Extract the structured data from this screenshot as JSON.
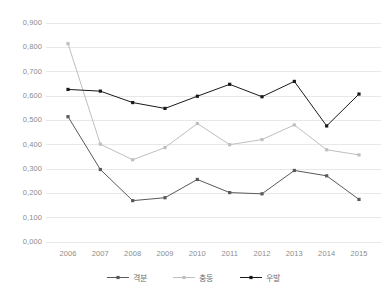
{
  "chart_data": {
    "type": "line",
    "title": "",
    "subtitle": "",
    "xlabel": "",
    "ylabel": "",
    "categories": [
      "2006",
      "2007",
      "2008",
      "2009",
      "2010",
      "2011",
      "2012",
      "2013",
      "2014",
      "2015"
    ],
    "ylim": [
      0.0,
      0.9
    ],
    "ytick_labels": [
      "0,900",
      "0,800",
      "0,700",
      "0,600",
      "0,500",
      "0,400",
      "0,300",
      "0,200",
      "0,100",
      "0,000"
    ],
    "ytick_values": [
      0.9,
      0.8,
      0.7,
      0.6,
      0.5,
      0.4,
      0.3,
      0.2,
      0.1,
      0.0
    ],
    "grid": "horizontal",
    "legend_position": "bottom",
    "decimal_separator": ",",
    "series": [
      {
        "name": "격분",
        "color": "#595959",
        "marker": "square",
        "values": [
          0.515,
          0.298,
          0.17,
          0.182,
          0.257,
          0.203,
          0.198,
          0.294,
          0.272,
          0.175
        ]
      },
      {
        "name": "충동",
        "color": "#bfbfbf",
        "marker": "square",
        "values": [
          0.815,
          0.402,
          0.338,
          0.388,
          0.487,
          0.4,
          0.421,
          0.481,
          0.379,
          0.358
        ]
      },
      {
        "name": "우발",
        "color": "#1a1a1a",
        "marker": "square",
        "values": [
          0.627,
          0.62,
          0.573,
          0.549,
          0.599,
          0.648,
          0.597,
          0.66,
          0.477,
          0.608
        ]
      }
    ]
  },
  "legend": {
    "items": [
      {
        "label": "격분",
        "color": "#595959"
      },
      {
        "label": "충동",
        "color": "#bfbfbf"
      },
      {
        "label": "우발",
        "color": "#1a1a1a"
      }
    ]
  },
  "axes": {
    "gridline_color": "#e8e8e8",
    "tick_text_color": "#8c8c8c"
  }
}
